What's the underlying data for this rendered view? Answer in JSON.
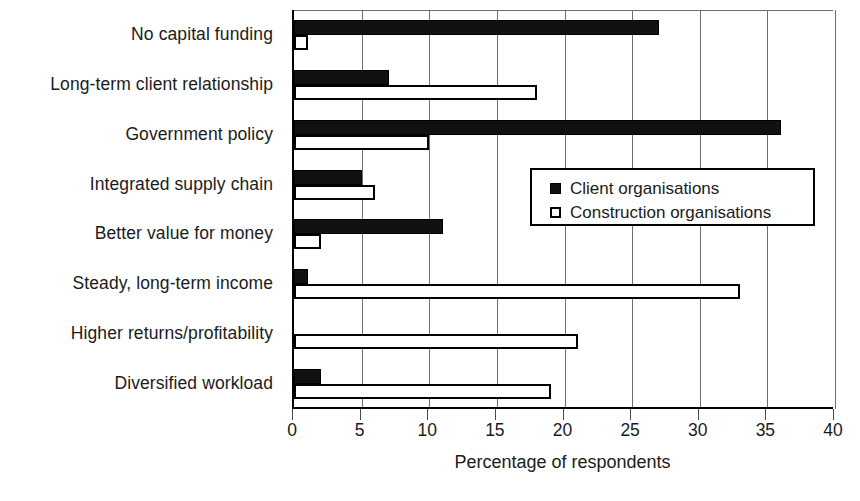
{
  "chart_data": {
    "type": "bar",
    "orientation": "horizontal",
    "title": "",
    "xlabel": "Percentage of respondents",
    "ylabel": "",
    "xlim": [
      0,
      40
    ],
    "xticks": [
      0,
      5,
      10,
      15,
      20,
      25,
      30,
      35,
      40
    ],
    "xtick_labels": [
      "0",
      "5",
      "10",
      "15",
      "20",
      "25",
      "30",
      "35",
      "40"
    ],
    "grid": "vertical",
    "legend_position": "center-right",
    "categories": [
      "No capital funding",
      "Long-term client relationship",
      "Government policy",
      "Integrated supply chain",
      "Better value for money",
      "Steady, long-term income",
      "Higher returns/profitability",
      "Diversified workload"
    ],
    "series": [
      {
        "name": "Client organisations",
        "style": "filled-black",
        "color": "#111111",
        "values": [
          27,
          7,
          36,
          5,
          11,
          1,
          0,
          2
        ]
      },
      {
        "name": "Construction organisations",
        "style": "hollow-outline",
        "color": "#ffffff",
        "values": [
          1,
          18,
          10,
          6,
          2,
          33,
          21,
          19
        ]
      }
    ]
  },
  "legend": {
    "items": [
      {
        "label": "Client organisations",
        "swatch": "filled"
      },
      {
        "label": "Construction organisations",
        "swatch": "hollow"
      }
    ]
  },
  "axis": {
    "x_title": "Percentage of respondents"
  },
  "colors": {
    "series_client": "#111111",
    "series_construction": "#ffffff",
    "outline": "#000000",
    "gridline": "#6e6e6e",
    "text": "#1b1b1b"
  }
}
